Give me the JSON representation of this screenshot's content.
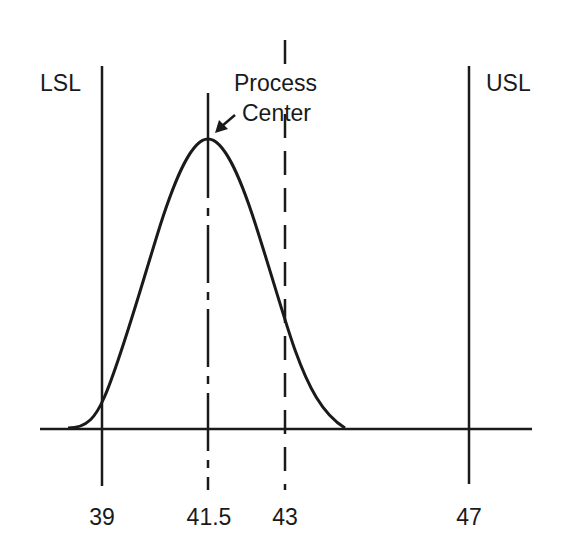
{
  "labels": {
    "lsl": "LSL",
    "usl": "USL",
    "process_center_line1": "Process",
    "process_center_line2": "Center"
  },
  "ticks": [
    {
      "value": "39",
      "x": 102
    },
    {
      "value": "41.5",
      "x": 208
    },
    {
      "value": "43",
      "x": 285
    },
    {
      "value": "47",
      "x": 469
    }
  ],
  "lines": {
    "lsl_value": 39,
    "process_center_value": 41.5,
    "marker_value": 43,
    "usl_value": 47
  },
  "colors": {
    "ink": "#1a1a1a",
    "background": "#ffffff"
  }
}
